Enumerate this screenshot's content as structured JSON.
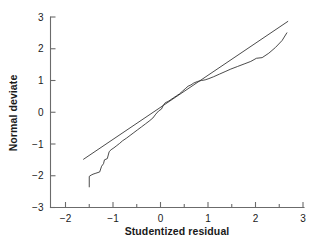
{
  "chart_data": {
    "type": "line",
    "title": "",
    "xlabel": "Studentized residual",
    "ylabel": "Normal deviate",
    "xlim": [
      -2.25,
      3.0
    ],
    "ylim": [
      -3.0,
      3.0
    ],
    "xticks": [
      -2,
      -1,
      0,
      1,
      2,
      3
    ],
    "xticklabels": [
      "-2",
      "-1",
      "0",
      "1",
      "2",
      "3"
    ],
    "xminorticks": [
      -1.5,
      -0.5,
      0.5,
      1.5,
      2.5
    ],
    "yticks": [
      -3,
      -2,
      -1,
      0,
      1,
      2,
      3
    ],
    "yticklabels": [
      "-3",
      "-2",
      "-1",
      "0",
      "1",
      "2",
      "3"
    ],
    "grid": false,
    "legend": null,
    "series": [
      {
        "name": "normal-probability-curve",
        "style": "stepped-line",
        "x": [
          -1.5,
          -1.5,
          -1.46,
          -1.42,
          -1.36,
          -1.28,
          -1.24,
          -1.2,
          -1.18,
          -1.12,
          -1.08,
          -1.04,
          -0.98,
          -0.92,
          -0.86,
          -0.8,
          -0.72,
          -0.64,
          -0.56,
          -0.48,
          -0.4,
          -0.32,
          -0.24,
          -0.16,
          -0.1,
          -0.04,
          0.02,
          0.06,
          0.1,
          0.16,
          0.22,
          0.28,
          0.34,
          0.4,
          0.46,
          0.52,
          0.58,
          0.64,
          0.7,
          0.78,
          0.86,
          0.94,
          1.02,
          1.12,
          1.24,
          1.36,
          1.48,
          1.62,
          1.76,
          1.9,
          2.02,
          2.14,
          2.28,
          2.42,
          2.56,
          2.66
        ],
        "y": [
          -2.35,
          -2.02,
          -1.98,
          -1.95,
          -1.92,
          -1.88,
          -1.7,
          -1.62,
          -1.5,
          -1.46,
          -1.24,
          -1.18,
          -1.12,
          -1.05,
          -0.98,
          -0.9,
          -0.82,
          -0.73,
          -0.64,
          -0.55,
          -0.46,
          -0.37,
          -0.28,
          -0.18,
          -0.06,
          0.04,
          0.1,
          0.22,
          0.3,
          0.34,
          0.4,
          0.46,
          0.52,
          0.58,
          0.66,
          0.74,
          0.82,
          0.86,
          0.92,
          0.97,
          1.0,
          1.02,
          1.06,
          1.12,
          1.2,
          1.28,
          1.36,
          1.44,
          1.52,
          1.6,
          1.7,
          1.72,
          1.86,
          2.04,
          2.26,
          2.5
        ]
      },
      {
        "name": "reference-line",
        "style": "straight-line",
        "x": [
          -1.62,
          2.68
        ],
        "y": [
          -1.48,
          2.86
        ]
      }
    ]
  },
  "axes": {
    "y_title": "Normal deviate",
    "x_title": "Studentized residual"
  },
  "colors": {
    "axis": "#6b6b6b",
    "data": "#2b2b2b",
    "text": "#1a1a1a",
    "background": "#ffffff"
  }
}
